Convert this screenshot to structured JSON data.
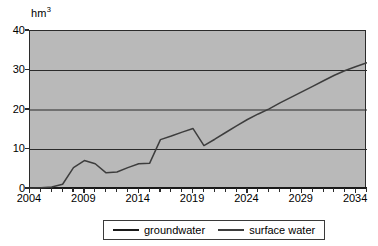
{
  "chart_data": {
    "type": "line",
    "title": "",
    "subtitle": "",
    "xlabel": "",
    "ylabel": "hm3",
    "ylabel_html": "hm",
    "ylabel_sup": "3",
    "xlim": [
      2004,
      2035
    ],
    "ylim": [
      0,
      40
    ],
    "yticks": [
      0,
      10,
      20,
      30,
      40
    ],
    "ytick_labels": [
      "0",
      "10",
      "20",
      "30",
      "40"
    ],
    "xticks": [
      2004,
      2009,
      2014,
      2019,
      2024,
      2029,
      2034
    ],
    "xtick_labels": [
      "2004",
      "2009",
      "2014",
      "2019",
      "2024",
      "2029",
      "2034"
    ],
    "x_minor_tick_step": 1,
    "grid": "horizontal",
    "plot_background": "#b9b9b9",
    "legend_position": "bottom",
    "x": [
      2004,
      2005,
      2006,
      2007,
      2008,
      2009,
      2010,
      2011,
      2012,
      2013,
      2014,
      2015,
      2016,
      2017,
      2018,
      2019,
      2020,
      2021,
      2022,
      2023,
      2024,
      2025,
      2026,
      2027,
      2028,
      2029,
      2030,
      2031,
      2032,
      2033,
      2034,
      2035
    ],
    "series": [
      {
        "name": "groundwater",
        "color": "#1a1a1a",
        "width": 2.6,
        "values": [
          0.15,
          0.15,
          0.15,
          0.15,
          0.15,
          0.15,
          0.15,
          0.15,
          0.15,
          0.15,
          0.15,
          0.15,
          0.15,
          0.15,
          0.15,
          0.15,
          0.15,
          0.15,
          0.15,
          0.15,
          0.15,
          0.15,
          0.15,
          0.15,
          0.15,
          0.15,
          0.15,
          0.15,
          0.15,
          0.15,
          0.15,
          0.15
        ]
      },
      {
        "name": "surface water",
        "color": "#3d3d3d",
        "width": 1.5,
        "values": [
          0.2,
          0.3,
          0.5,
          1.2,
          5.4,
          7.2,
          6.4,
          4.1,
          4.3,
          5.4,
          6.4,
          6.5,
          12.5,
          13.4,
          14.4,
          15.3,
          11.0,
          12.6,
          14.3,
          16.0,
          17.6,
          19.0,
          20.3,
          21.8,
          23.2,
          24.6,
          26.0,
          27.4,
          28.8,
          30.0,
          31.0,
          32.0
        ]
      }
    ]
  },
  "legend": {
    "items": [
      {
        "label": "groundwater",
        "style": "thick"
      },
      {
        "label": "surface water",
        "style": "thin"
      }
    ]
  },
  "axes": {
    "y_title": "hm",
    "y_title_sup": "3"
  }
}
